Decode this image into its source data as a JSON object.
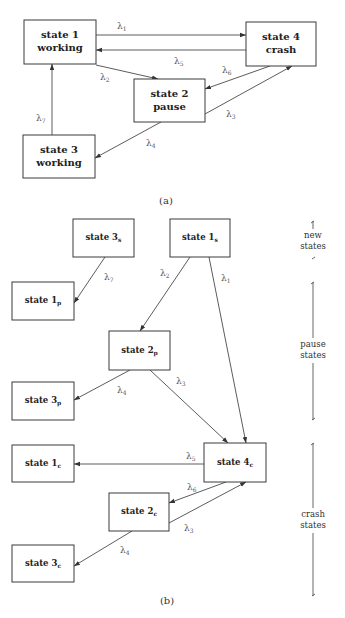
{
  "diagram_a": {
    "caption": "(a)",
    "nodes": [
      {
        "id": "s1",
        "lines": [
          "state 1",
          "working"
        ],
        "x": 24,
        "y": 20,
        "w": 72,
        "h": 44
      },
      {
        "id": "s4",
        "lines": [
          "state 4",
          "crash"
        ],
        "x": 246,
        "y": 22,
        "w": 70,
        "h": 44
      },
      {
        "id": "s2",
        "lines": [
          "state 2",
          "pause"
        ],
        "x": 134,
        "y": 79,
        "w": 71,
        "h": 43
      },
      {
        "id": "s3",
        "lines": [
          "state 3",
          "working"
        ],
        "x": 23,
        "y": 135,
        "w": 72,
        "h": 43
      }
    ],
    "edges": [
      {
        "from": "s1",
        "to": "s4",
        "label": "λ",
        "sub": "1",
        "x1": 96,
        "y1": 35,
        "x2": 246,
        "y2": 35,
        "lx": 117,
        "ly": 29
      },
      {
        "from": "s4",
        "to": "s1",
        "label": "λ",
        "sub": "5",
        "x1": 246,
        "y1": 50,
        "x2": 96,
        "y2": 50,
        "lx": 174,
        "ly": 64
      },
      {
        "from": "s1",
        "to": "s2",
        "label": "λ",
        "sub": "2",
        "x1": 96,
        "y1": 65,
        "x2": 158,
        "y2": 79,
        "lx": 100,
        "ly": 80
      },
      {
        "from": "s4",
        "to": "s2",
        "label": "λ",
        "sub": "6",
        "x1": 270,
        "y1": 66,
        "x2": 205,
        "y2": 89,
        "lx": 222,
        "ly": 73
      },
      {
        "from": "s2",
        "to": "s4",
        "label": "λ",
        "sub": "3",
        "x1": 205,
        "y1": 114,
        "x2": 292,
        "y2": 66,
        "lx": 226,
        "ly": 117
      },
      {
        "from": "s2",
        "to": "s3",
        "label": "λ",
        "sub": "4",
        "x1": 161,
        "y1": 122,
        "x2": 95,
        "y2": 158,
        "lx": 146,
        "ly": 146
      },
      {
        "from": "s3",
        "to": "s1",
        "label": "λ",
        "sub": "7",
        "x1": 52,
        "y1": 135,
        "x2": 52,
        "y2": 64,
        "lx": 36,
        "ly": 121
      }
    ]
  },
  "diagram_b": {
    "caption": "(b)",
    "nodes": [
      {
        "id": "s3s",
        "label": "state 3",
        "sub": "s",
        "x": 73,
        "y": 219,
        "w": 61,
        "h": 38
      },
      {
        "id": "s1s",
        "label": "state 1",
        "sub": "s",
        "x": 170,
        "y": 219,
        "w": 60,
        "h": 38
      },
      {
        "id": "s1p",
        "label": "state 1",
        "sub": "p",
        "x": 12,
        "y": 282,
        "w": 62,
        "h": 38
      },
      {
        "id": "s2p",
        "label": "state 2",
        "sub": "p",
        "x": 109,
        "y": 331,
        "w": 61,
        "h": 39
      },
      {
        "id": "s3p",
        "label": "state 3",
        "sub": "p",
        "x": 12,
        "y": 382,
        "w": 62,
        "h": 38
      },
      {
        "id": "s1c",
        "label": "state 1",
        "sub": "c",
        "x": 12,
        "y": 445,
        "w": 62,
        "h": 37
      },
      {
        "id": "s4c",
        "label": "state 4",
        "sub": "c",
        "x": 204,
        "y": 443,
        "w": 62,
        "h": 39
      },
      {
        "id": "s2c",
        "label": "state 2",
        "sub": "c",
        "x": 109,
        "y": 493,
        "w": 60,
        "h": 38
      },
      {
        "id": "s3c",
        "label": "state 3",
        "sub": "c",
        "x": 12,
        "y": 545,
        "w": 62,
        "h": 37
      }
    ],
    "edges": [
      {
        "from": "s3s",
        "to": "s1p",
        "label": "λ",
        "sub": "7",
        "x1": 105,
        "y1": 257,
        "x2": 74,
        "y2": 303,
        "lx": 104,
        "ly": 280
      },
      {
        "from": "s1s",
        "to": "s2p",
        "label": "λ",
        "sub": "2",
        "x1": 190,
        "y1": 257,
        "x2": 140,
        "y2": 331,
        "lx": 160,
        "ly": 276
      },
      {
        "from": "s1s",
        "to": "s4c",
        "label": "λ",
        "sub": "1",
        "x1": 209,
        "y1": 257,
        "x2": 246,
        "y2": 443,
        "lx": 221,
        "ly": 281
      },
      {
        "from": "s2p",
        "to": "s3p",
        "label": "λ",
        "sub": "4",
        "x1": 130,
        "y1": 370,
        "x2": 74,
        "y2": 400,
        "lx": 117,
        "ly": 393
      },
      {
        "from": "s2p",
        "to": "s4c",
        "label": "λ",
        "sub": "3",
        "x1": 150,
        "y1": 370,
        "x2": 228,
        "y2": 443,
        "lx": 176,
        "ly": 384
      },
      {
        "from": "s4c",
        "to": "s1c",
        "label": "λ",
        "sub": "5",
        "x1": 204,
        "y1": 464,
        "x2": 74,
        "y2": 464,
        "lx": 186,
        "ly": 459
      },
      {
        "from": "s4c",
        "to": "s2c",
        "label": "λ",
        "sub": "6",
        "x1": 226,
        "y1": 482,
        "x2": 169,
        "y2": 503,
        "lx": 187,
        "ly": 490
      },
      {
        "from": "s2c",
        "to": "s4c",
        "label": "λ",
        "sub": "3",
        "x1": 169,
        "y1": 523,
        "x2": 246,
        "y2": 482,
        "lx": 184,
        "ly": 531
      },
      {
        "from": "s2c",
        "to": "s3c",
        "label": "λ",
        "sub": "4",
        "x1": 132,
        "y1": 531,
        "x2": 74,
        "y2": 566,
        "lx": 120,
        "ly": 553
      }
    ],
    "groups": [
      {
        "id": "new",
        "lines": [
          "new",
          "states"
        ],
        "top": 221,
        "bottom": 259,
        "textY": [
          238,
          249
        ]
      },
      {
        "id": "pause",
        "lines": [
          "pause",
          "states"
        ],
        "top": 282,
        "bottom": 420,
        "textY": [
          347,
          358
        ]
      },
      {
        "id": "crash",
        "lines": [
          "crash",
          "states"
        ],
        "top": 443,
        "bottom": 596,
        "textY": [
          517,
          528
        ]
      }
    ],
    "bracket_x": 313
  }
}
